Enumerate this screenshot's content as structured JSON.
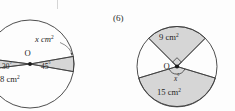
{
  "page": {
    "background_color": "#fdfdfd",
    "ink_color": "#1f1f1f",
    "shade_color": "#d6d6d6",
    "stroke_color": "#3a3a3a"
  },
  "figures": [
    {
      "id": "figure-left",
      "number_label": "",
      "shape": "circle",
      "center_label": "O",
      "shaded_sectors": [
        {
          "name": "right-sector",
          "label": "x cm",
          "superscript": "2",
          "angle_label": "45",
          "angle_unit": "°"
        },
        {
          "name": "left-sector",
          "label": "8 cm",
          "superscript": "2",
          "angle_label": "30",
          "angle_unit": "°"
        }
      ],
      "labels": {
        "unknown_area": "x cm",
        "unknown_area_sup": "2",
        "known_area": "8 cm",
        "known_area_sup": "2",
        "angle_right": "45",
        "angle_left": "30",
        "degree": "°",
        "centre": "O"
      }
    },
    {
      "id": "figure-right",
      "number_label": "(6)",
      "shape": "circle",
      "center_label": "O",
      "shaded_sectors": [
        {
          "name": "top-sector",
          "label": "9 cm",
          "superscript": "2",
          "angle_marker": "right-angle"
        },
        {
          "name": "bottom-sector",
          "label": "15 cm",
          "superscript": "2",
          "angle_label": "x",
          "angle_unit": "°"
        }
      ],
      "labels": {
        "top_area": "9 cm",
        "top_area_sup": "2",
        "bottom_area": "15 cm",
        "bottom_area_sup": "2",
        "unknown_angle": "x",
        "degree": "°",
        "centre": "O"
      }
    }
  ]
}
